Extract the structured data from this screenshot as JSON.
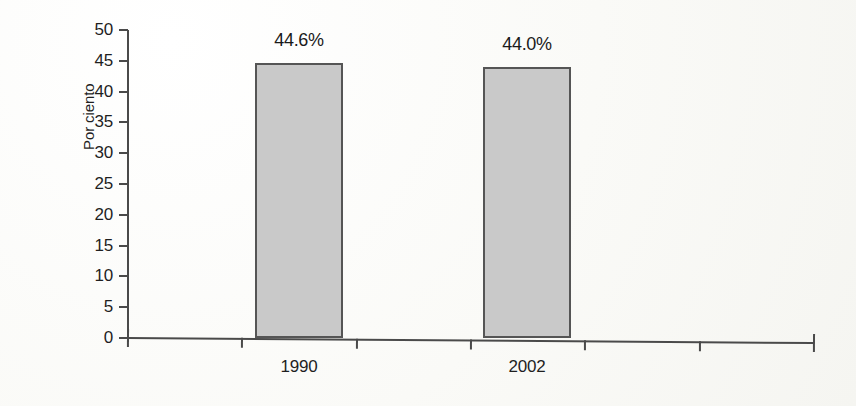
{
  "chart_data": {
    "type": "bar",
    "title": "",
    "xlabel": "",
    "ylabel": "Por ciento",
    "categories": [
      "1990",
      "2002"
    ],
    "values": [
      44.6,
      44.0
    ],
    "value_labels": [
      "44.6%",
      "44.0%"
    ],
    "ylim": [
      0,
      50
    ],
    "y_ticks": [
      0,
      5,
      10,
      15,
      20,
      25,
      30,
      35,
      40,
      45,
      50
    ],
    "y_tick_labels": [
      "0",
      "5",
      "10",
      "15",
      "20",
      "25",
      "30",
      "35",
      "40",
      "45",
      "50"
    ],
    "grid": false,
    "legend": null,
    "series": [
      {
        "name": "Por ciento",
        "values": [
          44.6,
          44.0
        ],
        "fill_color": "#c9c9c9",
        "border_color": "#555555"
      }
    ],
    "x_slot_count": 6,
    "bar_slots": [
      2,
      4
    ]
  },
  "style": {
    "background": "#fbfbf9",
    "axis_color": "#4a4a4a",
    "text_color": "#1f1f1f"
  }
}
